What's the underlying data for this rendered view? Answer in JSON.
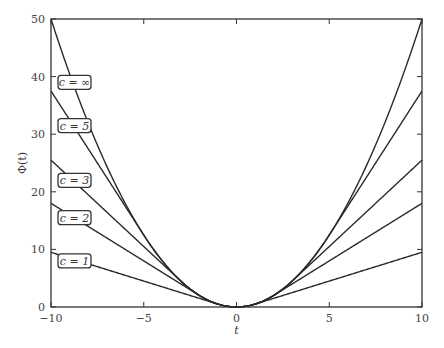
{
  "chart_data": {
    "type": "line",
    "title": "",
    "xlabel": "t",
    "ylabel": "Φ(t)",
    "xlim": [
      -10,
      10
    ],
    "ylim": [
      0,
      50
    ],
    "xticks": [
      -10,
      -5,
      0,
      5,
      10
    ],
    "yticks": [
      0,
      10,
      20,
      30,
      40,
      50
    ],
    "grid": false,
    "legend": "inline labels at left",
    "series": [
      {
        "name": "c = 1",
        "c": 1,
        "values_at_x": {
          "-10": 9.5,
          "0": 0,
          "10": 9.5
        }
      },
      {
        "name": "c = 2",
        "c": 2,
        "values_at_x": {
          "-10": 18,
          "0": 0,
          "10": 18
        }
      },
      {
        "name": "c = 3",
        "c": 3,
        "values_at_x": {
          "-10": 25.5,
          "0": 0,
          "10": 25.5
        }
      },
      {
        "name": "c = 5",
        "c": 5,
        "values_at_x": {
          "-10": 37.5,
          "0": 0,
          "10": 37.5
        }
      },
      {
        "name": "c = ∞",
        "c": null,
        "values_at_x": {
          "-10": 50,
          "0": 0,
          "10": 50
        }
      }
    ],
    "labels": [
      {
        "text": "c = ∞",
        "y": 39
      },
      {
        "text": "c = 5",
        "y": 31.5
      },
      {
        "text": "c = 3",
        "y": 22
      },
      {
        "text": "c = 2",
        "y": 15.5
      },
      {
        "text": "c = 1",
        "y": 8
      }
    ]
  }
}
